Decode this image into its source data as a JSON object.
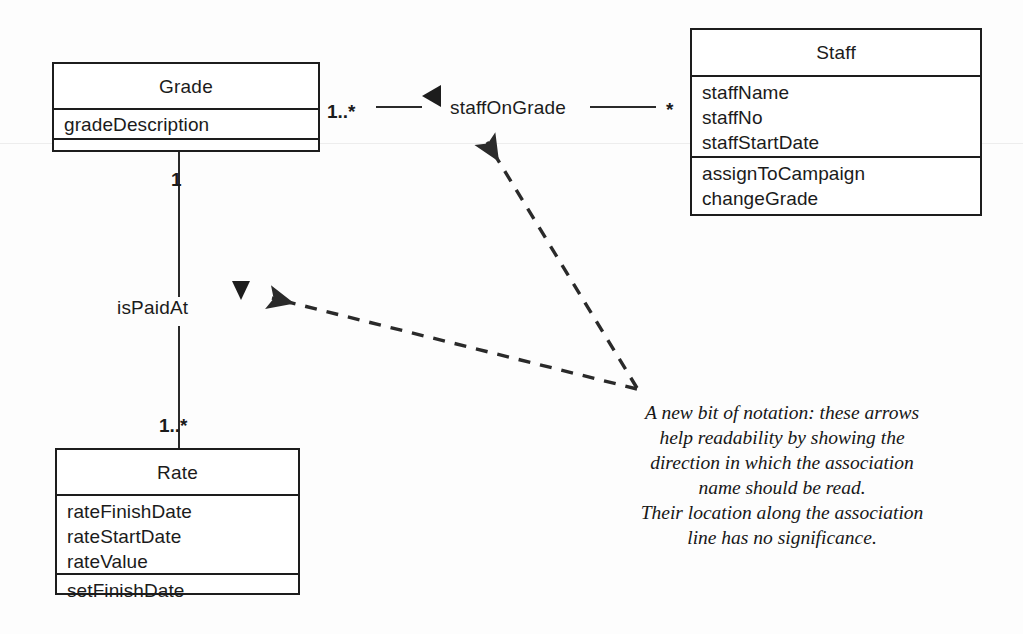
{
  "diagram": {
    "stroke_color": "#1d1d1d",
    "background_color": "#fdfdfd"
  },
  "classes": [
    {
      "key": "grade",
      "name": "Grade",
      "attributes": [
        "gradeDescription"
      ],
      "operations": []
    },
    {
      "key": "staff",
      "name": "Staff",
      "attributes": [
        "staffName",
        "staffNo",
        "staffStartDate"
      ],
      "operations": [
        "assignToCampaign",
        "changeGrade"
      ]
    },
    {
      "key": "rate",
      "name": "Rate",
      "attributes": [
        "rateFinishDate",
        "rateStartDate",
        "rateValue"
      ],
      "operations": [
        "setFinishDate"
      ]
    }
  ],
  "associations": [
    {
      "key": "staff-on-grade",
      "name": "staffOnGrade",
      "from_class": "Grade",
      "to_class": "Staff",
      "from_multiplicity": "1..*",
      "to_multiplicity": "*",
      "name_direction": "left",
      "direction_marker": "solid-triangle"
    },
    {
      "key": "is-paid-at",
      "name": "isPaidAt",
      "from_class": "Grade",
      "to_class": "Rate",
      "from_multiplicity": "1",
      "to_multiplicity": "1..*",
      "name_direction": "down",
      "direction_marker": "solid-triangle"
    }
  ],
  "note": {
    "lines": [
      "A new bit of notation: these arrows",
      "help readability by showing the",
      "direction in which the association",
      "name should be read.",
      "Their location along the association",
      "line has no significance."
    ]
  }
}
